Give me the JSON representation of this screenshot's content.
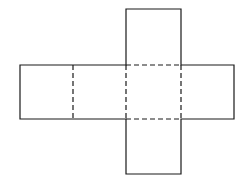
{
  "diagram": {
    "title": "",
    "stroke_color": "#1a1a1a",
    "background": "#ffffff",
    "faces": [
      {
        "name": "top-face",
        "x": 126,
        "y": 9,
        "w": 55,
        "h": 56
      },
      {
        "name": "left-face",
        "x": 20,
        "y": 65,
        "w": 53,
        "h": 54
      },
      {
        "name": "center-left-face",
        "x": 73,
        "y": 65,
        "w": 53,
        "h": 54
      },
      {
        "name": "center-face",
        "x": 126,
        "y": 65,
        "w": 55,
        "h": 54
      },
      {
        "name": "right-face",
        "x": 181,
        "y": 65,
        "w": 53,
        "h": 54
      },
      {
        "name": "bottom-face",
        "x": 126,
        "y": 119,
        "w": 55,
        "h": 55
      }
    ]
  }
}
